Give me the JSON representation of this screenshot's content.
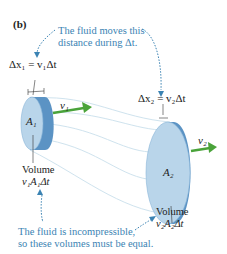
{
  "figure": {
    "panel_label": "(b)",
    "top_note": {
      "line1": "The fluid moves this",
      "line2": "distance during Δt."
    },
    "left_segment": {
      "equation": "Δx₁ = v₁Δt",
      "area_label": "A₁",
      "velocity_label": "v₁",
      "volume_label": "Volume",
      "volume_expr": "v₁A₁Δt"
    },
    "right_segment": {
      "equation": "Δx₂ = v₂Δt",
      "area_label": "A₂",
      "velocity_label": "v₂",
      "volume_label": "Volume",
      "volume_expr": "v₂A₂Δt"
    },
    "bottom_note": {
      "line1": "The fluid is incompressible,",
      "line2": "so these volumes must be equal."
    },
    "colors": {
      "annotation": "#3b83b3",
      "disk_face": "#b9d5ea",
      "disk_edge": "#5b93c4",
      "arrow": "#4aa33a",
      "streamline": "#cfe3ee"
    }
  }
}
